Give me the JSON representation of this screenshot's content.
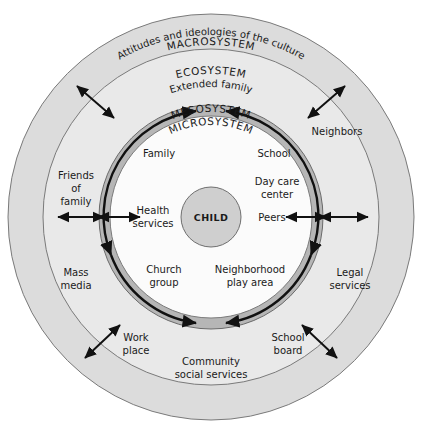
{
  "diagram": {
    "center": {
      "label": "CHILD",
      "fill": "#cfcfcf",
      "stroke": "#6f6f6f"
    },
    "rings": [
      {
        "id": "macrosystem",
        "title": "MACROSYSTEM",
        "subtitle": "Attitudes and ideologies of the culture",
        "fill": "#dcdcdc",
        "stroke": "#7a7a7a",
        "outer_radius": 203,
        "inner_radius": 168
      },
      {
        "id": "ecosystem",
        "title": "ECOSYSTEM",
        "subtitle": "Extended family",
        "fill": "#e9e9e9",
        "stroke": "#7a7a7a",
        "outer_radius": 168,
        "inner_radius": 112
      },
      {
        "id": "mesosystem",
        "title": "MESOSYSTEM",
        "subtitle": "",
        "fill": "#b6b6b6",
        "stroke": "#6a6a6a",
        "outer_radius": 112,
        "inner_radius": 101
      },
      {
        "id": "microsystem",
        "title": "MICROSYSTEM",
        "subtitle": "",
        "fill": "#fbfbfb",
        "stroke": "#7a7a7a",
        "outer_radius": 101,
        "inner_radius": 30
      }
    ],
    "microsystem_nodes": [
      {
        "id": "family",
        "lines": [
          "Family"
        ]
      },
      {
        "id": "school",
        "lines": [
          "School"
        ]
      },
      {
        "id": "day-care-center",
        "lines": [
          "Day care",
          "center"
        ]
      },
      {
        "id": "peers",
        "lines": [
          "Peers"
        ]
      },
      {
        "id": "health-services",
        "lines": [
          "Health",
          "services"
        ]
      },
      {
        "id": "church-group",
        "lines": [
          "Church",
          "group"
        ]
      },
      {
        "id": "neighborhood-play-area",
        "lines": [
          "Neighborhood",
          "play area"
        ]
      }
    ],
    "ecosystem_nodes": [
      {
        "id": "neighbors",
        "lines": [
          "Neighbors"
        ]
      },
      {
        "id": "friends-of-family",
        "lines": [
          "Friends",
          "of",
          "family"
        ]
      },
      {
        "id": "mass-media",
        "lines": [
          "Mass",
          "media"
        ]
      },
      {
        "id": "legal-services",
        "lines": [
          "Legal",
          "services"
        ]
      },
      {
        "id": "work-place",
        "lines": [
          "Work",
          "place"
        ]
      },
      {
        "id": "school-board",
        "lines": [
          "School",
          "board"
        ]
      },
      {
        "id": "community-social-services",
        "lines": [
          "Community",
          "social services"
        ]
      }
    ],
    "arrows": {
      "bidirectional_radial_count": 6,
      "mesosystem_circular_arrows": 2,
      "note": "double-headed straight arrows cross ring boundaries; two double-headed curved arrows run within the mesosystem band"
    }
  }
}
